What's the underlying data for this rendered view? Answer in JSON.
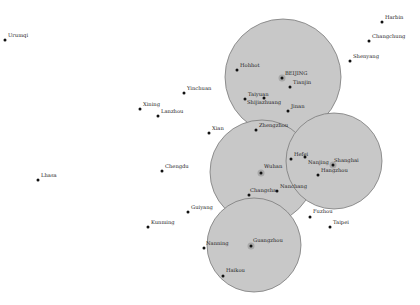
{
  "map": {
    "title": "China cities coverage map",
    "colors": {
      "region_fill": "#c8c8c8",
      "region_stroke": "#7a7a7a",
      "hub_fill": "#a9a9a9",
      "city_dot": "#111111",
      "label": "#222222",
      "background": "#ffffff"
    },
    "regions": [
      {
        "name": "BEIJING",
        "cx": 283,
        "cy": 77,
        "r": 58
      },
      {
        "name": "Wuhan",
        "cx": 262,
        "cy": 172,
        "r": 52
      },
      {
        "name": "Shanghai",
        "cx": 334,
        "cy": 161,
        "r": 48
      },
      {
        "name": "Guangzhou",
        "cx": 254,
        "cy": 245,
        "r": 47
      }
    ],
    "hubs": [
      {
        "name": "BEIJING",
        "x": 282,
        "y": 78
      },
      {
        "name": "Wuhan",
        "x": 261,
        "y": 173
      },
      {
        "name": "Shanghai",
        "x": 333,
        "y": 165
      },
      {
        "name": "Guangzhou",
        "x": 251,
        "y": 246
      }
    ],
    "cities": [
      {
        "name": "Urumqi",
        "x": 5,
        "y": 40,
        "lx": 8,
        "ly": 37
      },
      {
        "name": "Harbin",
        "x": 382,
        "y": 22,
        "lx": 385,
        "ly": 19
      },
      {
        "name": "Changchung",
        "x": 369,
        "y": 41,
        "lx": 372,
        "ly": 38
      },
      {
        "name": "Shenyang",
        "x": 350,
        "y": 61,
        "lx": 353,
        "ly": 58
      },
      {
        "name": "Hohhot",
        "x": 237,
        "y": 70,
        "lx": 240,
        "ly": 67
      },
      {
        "name": "BEIJING",
        "x": 282,
        "y": 78,
        "lx": 285,
        "ly": 75
      },
      {
        "name": "Tianjin",
        "x": 290,
        "y": 87,
        "lx": 293,
        "ly": 84
      },
      {
        "name": "Yinchuan",
        "x": 184,
        "y": 93,
        "lx": 187,
        "ly": 90
      },
      {
        "name": "Taiyuan",
        "x": 245,
        "y": 99,
        "lx": 248,
        "ly": 96
      },
      {
        "name": "Shijiazhuang",
        "x": 264,
        "y": 98,
        "lx": 247,
        "ly": 104
      },
      {
        "name": "Jinan",
        "x": 288,
        "y": 111,
        "lx": 291,
        "ly": 108
      },
      {
        "name": "Xining",
        "x": 140,
        "y": 109,
        "lx": 143,
        "ly": 106
      },
      {
        "name": "Lanzhou",
        "x": 158,
        "y": 116,
        "lx": 161,
        "ly": 113
      },
      {
        "name": "Zhengzhou",
        "x": 256,
        "y": 130,
        "lx": 259,
        "ly": 127
      },
      {
        "name": "Xian",
        "x": 209,
        "y": 133,
        "lx": 212,
        "ly": 130
      },
      {
        "name": "Hefei",
        "x": 291,
        "y": 159,
        "lx": 294,
        "ly": 156
      },
      {
        "name": "Nanjing",
        "x": 305,
        "y": 157,
        "lx": 308,
        "ly": 164
      },
      {
        "name": "Shanghai",
        "x": 333,
        "y": 165,
        "lx": 334,
        "ly": 162
      },
      {
        "name": "Hangzhou",
        "x": 318,
        "y": 175,
        "lx": 321,
        "ly": 172
      },
      {
        "name": "Wuhan",
        "x": 261,
        "y": 173,
        "lx": 264,
        "ly": 168
      },
      {
        "name": "Chengdu",
        "x": 162,
        "y": 171,
        "lx": 165,
        "ly": 168
      },
      {
        "name": "Lhasa",
        "x": 38,
        "y": 180,
        "lx": 41,
        "ly": 177
      },
      {
        "name": "Nanchang",
        "x": 277,
        "y": 191,
        "lx": 280,
        "ly": 188
      },
      {
        "name": "Changsha",
        "x": 249,
        "y": 195,
        "lx": 250,
        "ly": 192
      },
      {
        "name": "Fuzhou",
        "x": 310,
        "y": 217,
        "lx": 313,
        "ly": 213
      },
      {
        "name": "Taipei",
        "x": 330,
        "y": 227,
        "lx": 333,
        "ly": 224
      },
      {
        "name": "Guiyang",
        "x": 188,
        "y": 212,
        "lx": 191,
        "ly": 209
      },
      {
        "name": "Kunming",
        "x": 148,
        "y": 227,
        "lx": 151,
        "ly": 224
      },
      {
        "name": "Nanning",
        "x": 204,
        "y": 248,
        "lx": 206,
        "ly": 245
      },
      {
        "name": "Guangzhou",
        "x": 251,
        "y": 246,
        "lx": 253,
        "ly": 242
      },
      {
        "name": "Haikou",
        "x": 223,
        "y": 276,
        "lx": 226,
        "ly": 272
      }
    ]
  }
}
